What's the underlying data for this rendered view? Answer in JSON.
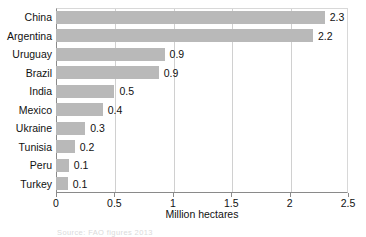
{
  "chart_data": {
    "type": "bar",
    "orientation": "horizontal",
    "title": "",
    "xlabel": "Million hectares",
    "ylabel": "",
    "categories": [
      "China",
      "Argentina",
      "Uruguay",
      "Brazil",
      "India",
      "Mexico",
      "Ukraine",
      "Tunisia",
      "Peru",
      "Turkey"
    ],
    "values": [
      2.3,
      2.2,
      0.93,
      0.88,
      0.5,
      0.4,
      0.25,
      0.16,
      0.11,
      0.1
    ],
    "data_labels": [
      "2.3",
      "2.2",
      "0.9",
      "0.9",
      "0.5",
      "0.4",
      "0.3",
      "0.2",
      "0.1",
      "0.1"
    ],
    "xlim": [
      0,
      2.5
    ],
    "xticks": [
      0,
      0.5,
      1,
      1.5,
      2,
      2.5
    ],
    "xtick_labels": [
      "0",
      "0.5",
      "1",
      "1.5",
      "2",
      "2.5"
    ],
    "grid": "vertical",
    "legend": "none",
    "bar_color": "#b9b9b9",
    "gridline_color": "#d0d0d0",
    "axis_color": "#8a8a8a",
    "text_color": "#111111"
  },
  "source_note": {
    "text": "Source: FAO figures 2013",
    "legible": false
  }
}
